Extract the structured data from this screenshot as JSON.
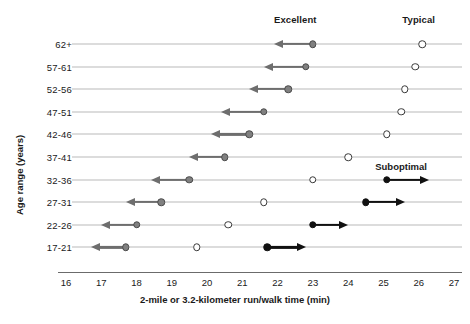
{
  "chart_data": {
    "type": "scatter",
    "title": "",
    "xlabel": "2-mile or 3.2-kilometer run/walk time (min)",
    "ylabel": "Age range (years)",
    "xlim": [
      16,
      27
    ],
    "xticks": [
      16,
      17,
      18,
      19,
      20,
      21,
      22,
      23,
      24,
      25,
      26,
      27
    ],
    "xtick_labels": [
      "16",
      "17",
      "18",
      "19",
      "20",
      "21",
      "22",
      "23",
      "24",
      "25",
      "26",
      "27"
    ],
    "grid": false,
    "legend_position": "top",
    "categories": [
      "62+",
      "57-61",
      "52-56",
      "47-51",
      "42-46",
      "37-41",
      "32-36",
      "27-31",
      "22-26",
      "17-21"
    ],
    "annotations": [
      {
        "text": "Excellent",
        "x": 22.5,
        "kind": "column-header"
      },
      {
        "text": "Typical",
        "x": 26.0,
        "kind": "column-header"
      },
      {
        "text": "Suboptimal",
        "x": 25.5,
        "kind": "series-callout"
      }
    ],
    "series": [
      {
        "name": "Excellent",
        "marker": "filled-gray-circle",
        "color": "#808080",
        "arrow_direction": "left",
        "values": [
          23.0,
          22.8,
          22.3,
          21.6,
          21.2,
          20.5,
          19.5,
          18.7,
          18.0,
          17.7
        ],
        "arrow_tips": [
          21.9,
          21.6,
          21.2,
          20.4,
          20.1,
          19.5,
          18.4,
          17.7,
          17.0,
          16.7
        ]
      },
      {
        "name": "Typical",
        "marker": "open-circle",
        "color": "#ffffff",
        "arrow_direction": "none",
        "values": [
          26.1,
          25.9,
          25.6,
          25.5,
          25.1,
          24.0,
          23.0,
          21.6,
          20.6,
          19.7
        ],
        "arrow_tips": [
          null,
          null,
          null,
          null,
          null,
          null,
          null,
          null,
          null,
          null
        ]
      },
      {
        "name": "Suboptimal",
        "marker": "filled-black-circle",
        "color": "#111111",
        "arrow_direction": "right",
        "values": [
          null,
          null,
          null,
          null,
          null,
          null,
          25.1,
          24.5,
          23.0,
          21.7
        ],
        "arrow_tips": [
          null,
          null,
          null,
          null,
          null,
          null,
          26.3,
          25.6,
          24.0,
          22.8
        ]
      }
    ]
  }
}
